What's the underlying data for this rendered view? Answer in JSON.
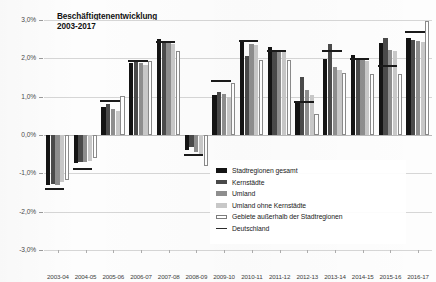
{
  "chart_data": {
    "type": "bar",
    "title": "Beschäftigtenentwicklung\n2003-2017",
    "xlabel": "",
    "ylabel": "",
    "ylim": [
      -3.0,
      3.0
    ],
    "ytick_step": 1.0,
    "ytick_labels": [
      "3,0%",
      "2,0%",
      "1,0%",
      "0,0%",
      "-1,0%",
      "-2,0%",
      "-3,0%"
    ],
    "ytick_values": [
      3.0,
      2.0,
      1.0,
      0.0,
      -1.0,
      -2.0,
      -3.0
    ],
    "grid": true,
    "legend_position": "center-right-inside",
    "value_unit": "%",
    "categories": [
      "2003-04",
      "2004-05",
      "2005-06",
      "2006-07",
      "2007-08",
      "2008-09",
      "2009-10",
      "2010-11",
      "2011-12",
      "2012-13",
      "2013-14",
      "2014-15",
      "2015-16",
      "2016-17"
    ],
    "series": [
      {
        "name": "Stadtregionen gesamt",
        "color": "#141414",
        "kind": "bar",
        "values": [
          -1.3,
          -0.72,
          0.72,
          1.88,
          2.5,
          -0.4,
          1.05,
          2.42,
          2.3,
          0.88,
          1.97,
          2.1,
          2.4,
          2.52
        ]
      },
      {
        "name": "Kernstädte",
        "color": "#4a4a4a",
        "kind": "bar",
        "values": [
          -1.28,
          -0.7,
          0.8,
          1.9,
          2.43,
          -0.32,
          1.12,
          2.05,
          2.18,
          1.52,
          2.38,
          2.02,
          2.54,
          2.48
        ]
      },
      {
        "name": "Umland",
        "color": "#8e8e8e",
        "kind": "bar",
        "values": [
          -1.3,
          -0.7,
          0.68,
          1.88,
          2.4,
          -0.45,
          1.08,
          2.38,
          2.22,
          1.18,
          1.78,
          1.98,
          2.22,
          2.46
        ]
      },
      {
        "name": "Umland ohne Kernstädte",
        "color": "#c8c8c8",
        "kind": "bar",
        "values": [
          -1.22,
          -0.68,
          0.62,
          1.82,
          2.38,
          -0.5,
          1.0,
          2.36,
          2.2,
          1.05,
          1.7,
          1.92,
          2.18,
          2.42
        ]
      },
      {
        "name": "Gebiete außerhalb der Stadtregionen",
        "color": "#ffffff",
        "kind": "bar",
        "values": [
          -1.18,
          -0.6,
          1.02,
          1.92,
          2.18,
          -0.8,
          1.35,
          1.96,
          1.95,
          0.55,
          1.62,
          1.58,
          1.6,
          2.98
        ]
      },
      {
        "name": "Deutschland",
        "color": "#1a1a1a",
        "kind": "marker-line",
        "values": [
          -1.4,
          -0.88,
          0.88,
          1.92,
          2.42,
          -0.52,
          1.42,
          2.45,
          2.2,
          0.85,
          2.18,
          1.97,
          1.8,
          2.7
        ]
      }
    ]
  }
}
